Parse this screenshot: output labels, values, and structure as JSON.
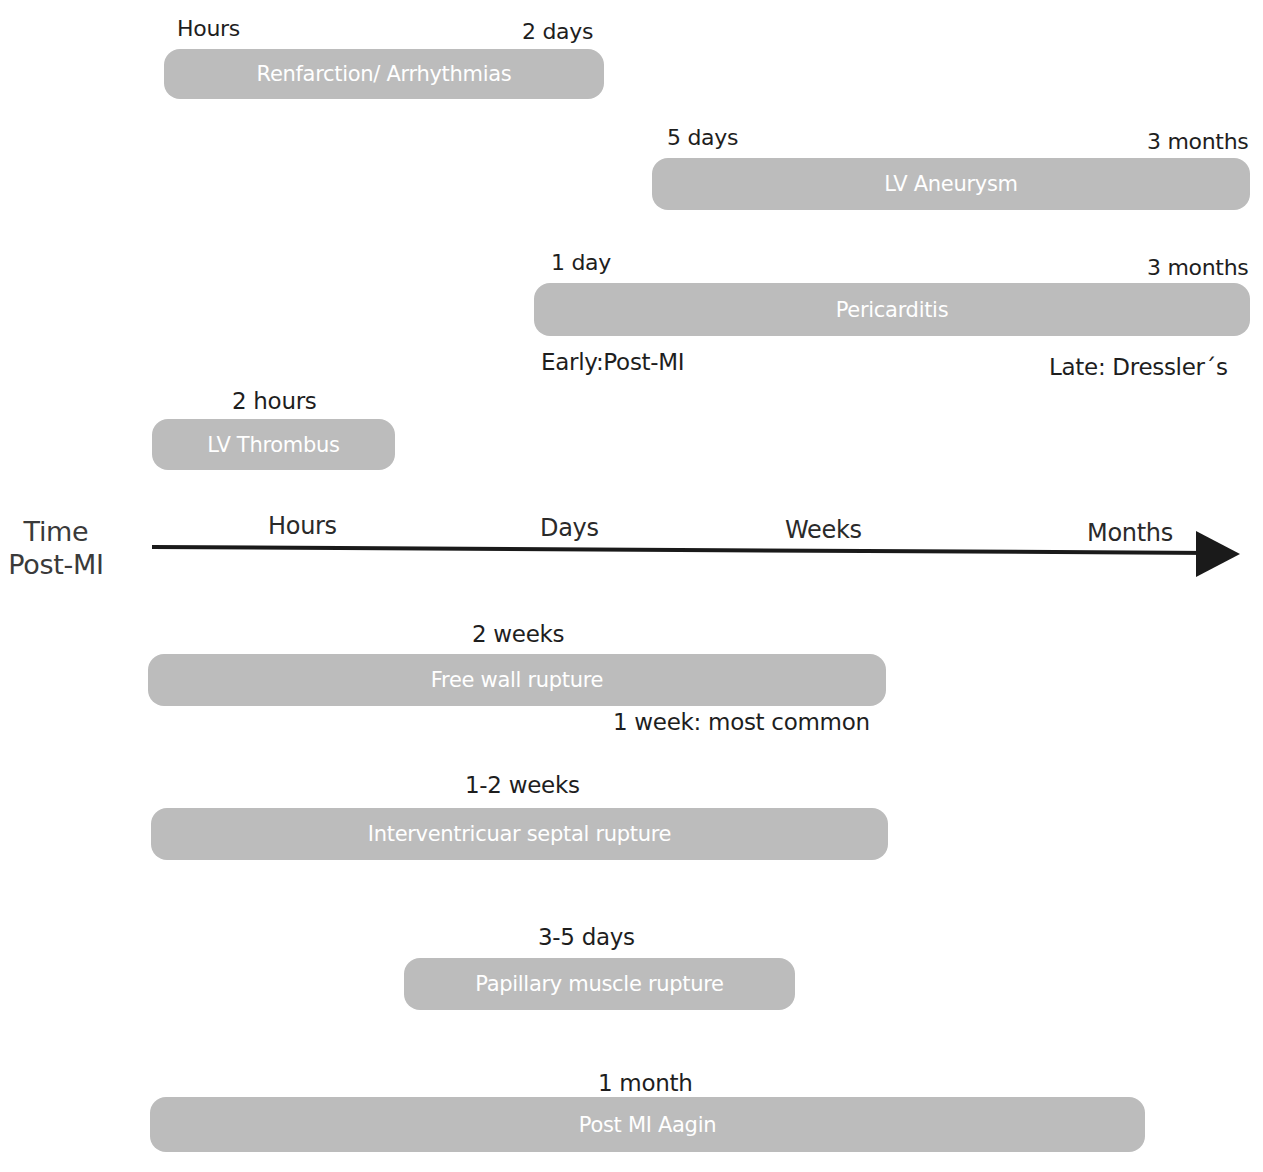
{
  "axis": {
    "title_line1": "Time",
    "title_line2": "Post-MI",
    "ticks": [
      "Hours",
      "Days",
      "Weeks",
      "Months"
    ],
    "arrow_icon": "arrow-right-icon"
  },
  "complications": [
    {
      "name": "Renfarction/ Arrhythmias",
      "start_label": "Hours",
      "end_label": "2 days"
    },
    {
      "name": "LV Aneurysm",
      "start_label": "5 days",
      "end_label": "3 months"
    },
    {
      "name": "Pericarditis",
      "start_label": "1 day",
      "end_label": "3 months",
      "note_left": "Early:Post-MI",
      "note_right": "Late: Dressler´s"
    },
    {
      "name": "LV Thrombus",
      "peak_label": "2 hours"
    },
    {
      "name": "Free wall rupture",
      "peak_label": "2 weeks",
      "note": "1 week: most common"
    },
    {
      "name": "Interventricuar septal rupture",
      "peak_label": "1-2 weeks"
    },
    {
      "name": "Papillary muscle rupture",
      "peak_label": "3-5 days"
    },
    {
      "name": "Post MI Aagin",
      "peak_label": "1 month"
    }
  ],
  "colors": {
    "bar": "#bcbcbc",
    "bar_text": "#ffffff",
    "text": "#1e1e1e",
    "axis": "#1a1a1a"
  }
}
